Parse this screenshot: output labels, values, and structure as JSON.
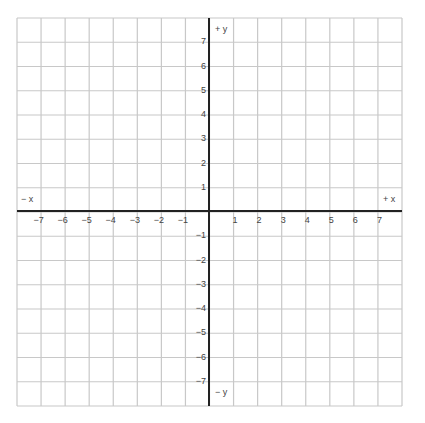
{
  "diagram": {
    "grid": {
      "left": 17,
      "top": 18,
      "right": 402,
      "bottom": 406,
      "columns": 16,
      "rows": 16,
      "line_color": "#c8c8c8",
      "axis_color": "#222222"
    },
    "origin": {
      "x": 209,
      "y": 211
    },
    "axes": {
      "x_positive_label": "+ x",
      "x_negative_label": "− x",
      "y_positive_label": "+ y",
      "y_negative_label": "− y"
    },
    "x_ticks": [
      "−7",
      "−6",
      "−5",
      "−4",
      "−3",
      "−2",
      "−1",
      "1",
      "2",
      "3",
      "4",
      "5",
      "6",
      "7"
    ],
    "x_tick_values": [
      -7,
      -6,
      -5,
      -4,
      -3,
      -2,
      -1,
      1,
      2,
      3,
      4,
      5,
      6,
      7
    ],
    "y_ticks": [
      "7",
      "6",
      "5",
      "4",
      "3",
      "2",
      "1",
      "−1",
      "−2",
      "−3",
      "−4",
      "−5",
      "−6",
      "−7"
    ],
    "y_tick_values": [
      7,
      6,
      5,
      4,
      3,
      2,
      1,
      -1,
      -2,
      -3,
      -4,
      -5,
      -6,
      -7
    ]
  }
}
